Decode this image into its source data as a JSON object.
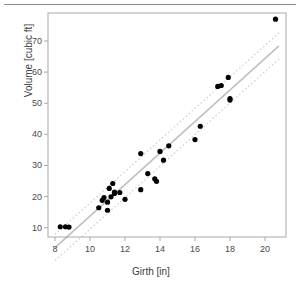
{
  "figure": {
    "name": "girth-volume-scatterplot",
    "top_rule_color": "#8d8d8d",
    "background": "#ffffff"
  },
  "chart_data": {
    "type": "scatter",
    "title": "",
    "subtitle": "",
    "xlabel": "Girth [in]",
    "ylabel": "Volume [cubic ft]",
    "xlim": [
      7.6,
      21.2
    ],
    "ylim": [
      7.0,
      79.0
    ],
    "xticks": [
      8,
      10,
      12,
      14,
      16,
      18,
      20
    ],
    "yticks": [
      10,
      20,
      30,
      40,
      50,
      60,
      70
    ],
    "xtick_labels": [
      "8",
      "10",
      "12",
      "14",
      "16",
      "18",
      "20"
    ],
    "ytick_labels": [
      "10",
      "20",
      "30",
      "40",
      "50",
      "60",
      "70"
    ],
    "grid": false,
    "legend": null,
    "legend_position": "none",
    "box": true,
    "point_color": "#000000",
    "point_shape": "filled-circle",
    "point_radius": 2.6,
    "series": [
      {
        "name": "trees",
        "x": [
          8.3,
          8.6,
          8.8,
          10.5,
          10.7,
          10.8,
          11.0,
          11.0,
          11.1,
          11.2,
          11.3,
          11.4,
          11.4,
          11.7,
          12.0,
          12.9,
          12.9,
          13.3,
          13.7,
          13.8,
          14.0,
          14.2,
          14.5,
          16.0,
          16.3,
          17.3,
          17.5,
          17.9,
          18.0,
          18.0,
          20.6
        ],
        "y": [
          10.3,
          10.3,
          10.2,
          16.4,
          18.8,
          19.7,
          15.6,
          18.2,
          22.6,
          19.9,
          24.2,
          21.0,
          21.4,
          21.3,
          19.1,
          22.2,
          33.8,
          27.4,
          25.7,
          24.9,
          34.5,
          31.7,
          36.3,
          38.3,
          42.6,
          55.4,
          55.7,
          58.3,
          51.5,
          51.0,
          77.0
        ]
      }
    ],
    "fit_line": {
      "name": "regression-line",
      "style": "solid",
      "color": "#bdbdbd",
      "width": 1.4,
      "intercept": -36.94,
      "slope": 5.066,
      "x_start": 8.0,
      "x_end": 20.8
    },
    "confidence_bands": [
      {
        "name": "upper-confidence-band",
        "style": "dotted",
        "color": "#cfcfcf",
        "width": 1.2,
        "offset": 4.2
      },
      {
        "name": "lower-confidence-band",
        "style": "dotted",
        "color": "#cfcfcf",
        "width": 1.2,
        "offset": -4.2
      }
    ],
    "axis": {
      "box_color": "#a8a8a8",
      "tick_color": "#a8a8a8",
      "tick_length": 4
    }
  }
}
